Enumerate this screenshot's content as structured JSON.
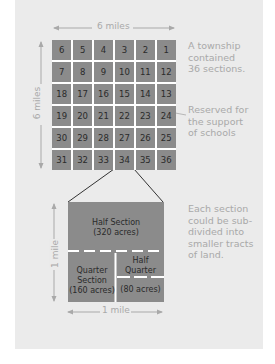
{
  "township": {
    "width_label": "6 miles",
    "height_label": "6 miles",
    "sections": [
      [
        6,
        5,
        4,
        3,
        2,
        1
      ],
      [
        7,
        8,
        9,
        10,
        11,
        12
      ],
      [
        18,
        17,
        16,
        15,
        14,
        13
      ],
      [
        19,
        20,
        21,
        22,
        23,
        24
      ],
      [
        30,
        29,
        28,
        27,
        26,
        25
      ],
      [
        31,
        32,
        33,
        34,
        35,
        36
      ]
    ],
    "note": [
      "A township",
      "contained",
      "36 sections."
    ],
    "school_note": [
      "Reserved for",
      "the support",
      "of schools"
    ],
    "school_sections": [
      16,
      24
    ],
    "expanded_section": 34
  },
  "section": {
    "width_label": "1 mile",
    "height_label": "1 mile",
    "half_section": [
      "Half Section",
      "(320 acres)"
    ],
    "quarter_section": [
      "Quarter",
      "Section",
      "(160 acres)"
    ],
    "half_quarter": [
      "Half",
      "Quarter"
    ],
    "half_quarter_acres": "(80 acres)",
    "note": [
      "Each section",
      "could be sub-",
      "divided into",
      "smaller tracts",
      "of land."
    ]
  },
  "colors": {
    "panel": "#ebebeb",
    "cell": "#8b8b8b",
    "text_light": "#a9a9a9",
    "text_dark": "#2a2a2a"
  }
}
